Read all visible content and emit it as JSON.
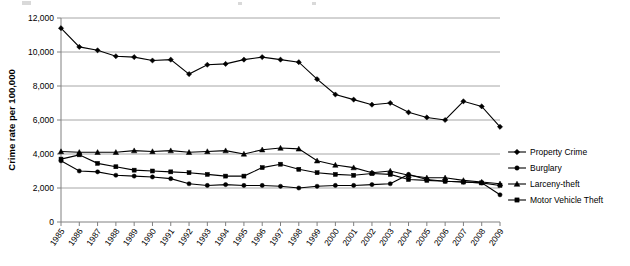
{
  "chart_data": {
    "type": "line",
    "title": "",
    "xlabel": "",
    "ylabel": "Crime rate per 100,000",
    "ylim": [
      0,
      12000
    ],
    "yticks": [
      "0",
      "2,000",
      "4,000",
      "6,000",
      "8,000",
      "10,000",
      "12,000"
    ],
    "ytick_values": [
      0,
      2000,
      4000,
      6000,
      8000,
      10000,
      12000
    ],
    "grid": true,
    "legend_position": "right",
    "categories": [
      "1985",
      "1986",
      "1987",
      "1988",
      "1989",
      "1990",
      "1991",
      "1992",
      "1993",
      "1994",
      "1995",
      "1996",
      "1997",
      "1998",
      "1999",
      "2000",
      "2001",
      "2002",
      "2003",
      "2004",
      "2005",
      "2006",
      "2007",
      "2008",
      "2009"
    ],
    "x": [
      1985,
      1986,
      1987,
      1988,
      1989,
      1990,
      1991,
      1992,
      1993,
      1994,
      1995,
      1996,
      1997,
      1998,
      1999,
      2000,
      2001,
      2002,
      2003,
      2004,
      2005,
      2006,
      2007,
      2008,
      2009
    ],
    "series": [
      {
        "name": "Property Crime",
        "marker": "diamond",
        "values": [
          11400,
          10300,
          10100,
          9750,
          9700,
          9500,
          9550,
          8700,
          9250,
          9300,
          9550,
          9700,
          9550,
          9400,
          8400,
          7500,
          7200,
          6900,
          7000,
          6450,
          6150,
          6000,
          7100,
          6800,
          5600
        ]
      },
      {
        "name": "Burglary",
        "marker": "circle",
        "values": [
          3600,
          3000,
          2950,
          2750,
          2700,
          2650,
          2550,
          2250,
          2150,
          2200,
          2150,
          2150,
          2100,
          2000,
          2100,
          2150,
          2150,
          2200,
          2250,
          2800,
          2500,
          2400,
          2350,
          2300,
          1600
        ]
      },
      {
        "name": "Larceny-theft",
        "marker": "triangle",
        "values": [
          4150,
          4100,
          4100,
          4100,
          4200,
          4150,
          4200,
          4100,
          4150,
          4200,
          4000,
          4250,
          4350,
          4300,
          3600,
          3350,
          3200,
          2900,
          3000,
          2750,
          2600,
          2600,
          2450,
          2350,
          2250
        ]
      },
      {
        "name": "Motor Vehicle Theft",
        "marker": "square",
        "values": [
          3700,
          3950,
          3450,
          3250,
          3050,
          3000,
          2950,
          2900,
          2800,
          2700,
          2700,
          3200,
          3400,
          3100,
          2900,
          2800,
          2750,
          2850,
          2800,
          2500,
          2450,
          2400,
          2350,
          2300,
          2150
        ]
      }
    ]
  },
  "legend": {
    "items": [
      {
        "label": "Property Crime",
        "marker": "diamond"
      },
      {
        "label": "Burglary",
        "marker": "circle"
      },
      {
        "label": "Larceny-theft",
        "marker": "triangle"
      },
      {
        "label": "Motor Vehicle Theft",
        "marker": "square"
      }
    ]
  }
}
